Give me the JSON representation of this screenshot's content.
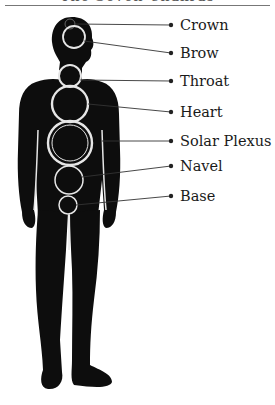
{
  "diagram": {
    "title": "The Seven Chakras",
    "colors": {
      "silhouette": "#0d0d0d",
      "rings": "#e6e6e6",
      "leader": "#333333",
      "text": "#1a1a1a"
    },
    "chakras": [
      {
        "name": "Crown",
        "label_y": 25
      },
      {
        "name": "Brow",
        "label_y": 53
      },
      {
        "name": "Throat",
        "label_y": 81
      },
      {
        "name": "Heart",
        "label_y": 112
      },
      {
        "name": "Solar Plexus",
        "label_y": 141
      },
      {
        "name": "Navel",
        "label_y": 166
      },
      {
        "name": "Base",
        "label_y": 196
      }
    ]
  }
}
